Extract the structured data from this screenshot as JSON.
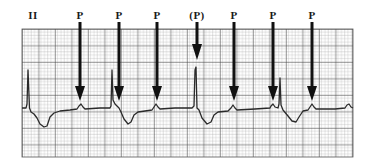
{
  "figure": {
    "lead_label": "II",
    "markers": [
      {
        "label": "P",
        "x": 80
      },
      {
        "label": "P",
        "x": 119
      },
      {
        "label": "P",
        "x": 157
      },
      {
        "label": "(P)",
        "x": 197
      },
      {
        "label": "P",
        "x": 234
      },
      {
        "label": "P",
        "x": 273
      },
      {
        "label": "P",
        "x": 312
      }
    ],
    "colors": {
      "grid_minor": "#9a9a9a",
      "grid_major": "#3a3a3a",
      "trace": "#2a2a2a",
      "arrow": "#111111",
      "background": "#ffffff"
    }
  }
}
